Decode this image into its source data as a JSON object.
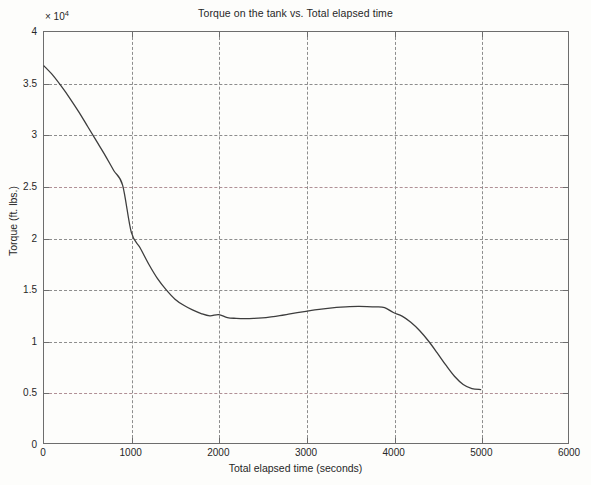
{
  "chart_data": {
    "type": "line",
    "title": "Torque on the tank vs. Total elapsed time",
    "xlabel": "Total elapsed time (seconds)",
    "ylabel": "Torque (ft. lbs.)",
    "y_multiplier_label": "× 10",
    "y_multiplier_exponent": "4",
    "y_scale_factor": 10000,
    "xlim": [
      0,
      6000
    ],
    "ylim": [
      0,
      40000
    ],
    "xticks": [
      0,
      1000,
      2000,
      3000,
      4000,
      5000,
      6000
    ],
    "xtick_labels": [
      "0",
      "1000",
      "2000",
      "3000",
      "4000",
      "5000",
      "6000"
    ],
    "yticks": [
      0,
      5000,
      10000,
      15000,
      20000,
      25000,
      30000,
      35000,
      40000
    ],
    "ytick_labels": [
      "0",
      "0.5",
      "1",
      "1.5",
      "2",
      "2.5",
      "3",
      "3.5",
      "4"
    ],
    "grid": true,
    "grid_style": "dashed",
    "legend": null,
    "series": [
      {
        "name": "Torque",
        "color": "#3d3d3d",
        "line_width": 1.3,
        "x": [
          0,
          100,
          200,
          300,
          400,
          500,
          600,
          700,
          800,
          900,
          1000,
          1100,
          1200,
          1300,
          1400,
          1500,
          1600,
          1700,
          1800,
          1900,
          2000,
          2100,
          2200,
          2300,
          2400,
          2500,
          2600,
          2700,
          2800,
          2900,
          3000,
          3100,
          3200,
          3300,
          3400,
          3500,
          3600,
          3700,
          3800,
          3900,
          4000,
          4100,
          4200,
          4300,
          4400,
          4500,
          4600,
          4700,
          4800,
          4900,
          5000
        ],
        "y": [
          36700,
          35800,
          34700,
          33500,
          32200,
          30800,
          29400,
          28000,
          26500,
          25100,
          20500,
          19000,
          17400,
          16000,
          14900,
          14000,
          13400,
          12950,
          12600,
          12380,
          12500,
          12200,
          12130,
          12100,
          12120,
          12180,
          12280,
          12400,
          12540,
          12680,
          12820,
          12950,
          13060,
          13150,
          13220,
          13270,
          13290,
          13280,
          13250,
          13180,
          12700,
          12350,
          11750,
          10950,
          9950,
          8800,
          7600,
          6500,
          5700,
          5300,
          5200
        ],
        "annotations": [
          {
            "label": "initial value",
            "x": 0,
            "y": 36700
          },
          {
            "label": "local minimum",
            "x": 2300,
            "y": 12100
          },
          {
            "label": "local maximum",
            "x": 3600,
            "y": 13290
          },
          {
            "label": "final value",
            "x": 5000,
            "y": 5200
          }
        ]
      }
    ]
  },
  "chart": {
    "title": "Torque on the tank vs. Total elapsed time",
    "x_axis_title": "Total elapsed time (seconds)",
    "y_axis_title": "Torque (ft. lbs.)",
    "exponent_prefix": "× 10",
    "exponent_power": "4",
    "x_tick_labels": [
      "0",
      "1000",
      "2000",
      "3000",
      "4000",
      "5000",
      "6000"
    ],
    "y_tick_labels": [
      "0",
      "0.5",
      "1",
      "1.5",
      "2",
      "2.5",
      "3",
      "3.5",
      "4"
    ]
  }
}
